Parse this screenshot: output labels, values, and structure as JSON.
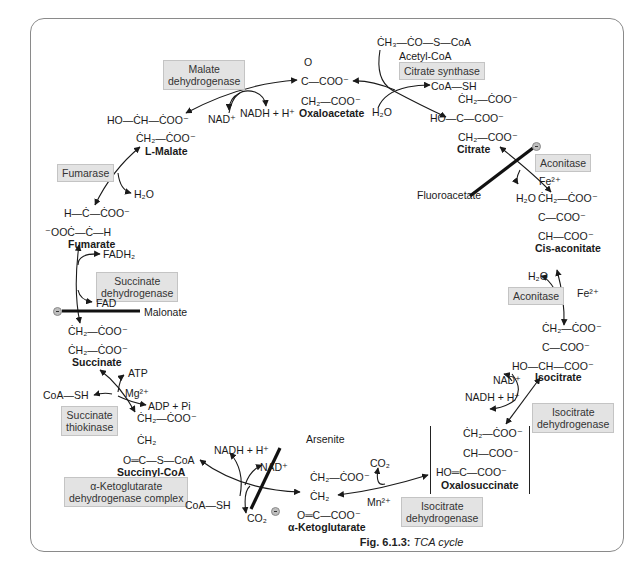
{
  "caption": {
    "label": "Fig. 6.1.3:",
    "title": "TCA cycle"
  },
  "compounds": {
    "acetyl_coa": {
      "formula": "ĊH₃—ĊO—S—CoA",
      "name": "Acetyl-CoA"
    },
    "oxaloacetate": {
      "top": "O",
      "line1": "C—COO⁻",
      "line2": "CH₂—COO⁻",
      "name": "Oxaloacetate"
    },
    "citrate": {
      "line1": "ĊH₂—ĊOO⁻",
      "line2": "HO—C—COO⁻",
      "line3": "CH₂—COO⁻",
      "name": "Citrate"
    },
    "cis_aconitate": {
      "line1": "ĊH₂—ĊOO⁻",
      "line2": "C—COO⁻",
      "line3": "CH—COO⁻",
      "name": "Cis-aconitate"
    },
    "isocitrate": {
      "line1": "ĊH₂—ĊOO⁻",
      "line2": "C—COO⁻",
      "line3": "HO—CH—COO⁻",
      "name": "Isocitrate"
    },
    "oxalosuccinate": {
      "line1": "ĊH₂—ĊOO⁻",
      "line2": "CH—COO⁻",
      "line3": "HO═C—COO⁻",
      "name": "Oxalosuccinate"
    },
    "alpha_ketoglutarate": {
      "line1": "ĊH₂—ĊOO⁻",
      "line2": "ĊH₂",
      "line3": "O═C—COO⁻",
      "name": "α-Ketoglutarate"
    },
    "succinyl_coa": {
      "line1": "ĊH₂—ĊOO⁻",
      "line2": "ĊH₂",
      "line3": "O═C—S—CoA",
      "name": "Succinyl-CoA"
    },
    "succinate": {
      "line1": "ĊH₂—ĊOO⁻",
      "line2": "ĊH₂—ĊOO⁻",
      "name": "Succinate"
    },
    "fumarate": {
      "line1": "H—Ċ—ĊOO⁻",
      "line2": "⁻OOĊ—Ċ—H",
      "name": "Fumarate"
    },
    "l_malate": {
      "line1": "HO—ĊH—ĊOO⁻",
      "line2": "ĊH₂—ĊOO⁻",
      "name": "L-Malate"
    }
  },
  "enzymes": {
    "citrate_synthase": "Citrate synthase",
    "aconitase_1": "Aconitase",
    "aconitase_2": "Aconitase",
    "isocitrate_dh_1": [
      "Isocitrate",
      "dehydrogenase"
    ],
    "isocitrate_dh_2": [
      "Isocitrate",
      "dehydrogenase"
    ],
    "akg_dh_complex": [
      "α-Ketoglutarate",
      "dehydrogenase complex"
    ],
    "succinate_thiokinase": [
      "Succinate",
      "thiokinase"
    ],
    "succinate_dh": [
      "Succinate",
      "dehydrogenase"
    ],
    "fumarase": "Fumarase",
    "malate_dh": [
      "Malate",
      "dehydrogenase"
    ]
  },
  "cofactors": {
    "h2o_citrate": "H₂O",
    "coash_citrate": "CoA—SH",
    "fe_1": "Fe²⁺",
    "h2o_aconitase_1": "H₂O",
    "fe_2": "Fe²⁺",
    "h2o_aconitase_2": "H₂O",
    "nad_isocitrate": "NAD⁺",
    "nadh_isocitrate": "NADH + H⁺",
    "co2_oxalosuccinate": "CO₂",
    "mn": "Mn²⁺",
    "nadh_akg": "NADH + H⁺",
    "nad_akg": "NAD⁺",
    "coash_akg": "CoA—SH",
    "co2_akg": "CO₂",
    "atp": "ATP",
    "mg": "Mg²⁺",
    "adp_pi": "ADP + Pi",
    "coash_thiokinase": "CoA—SH",
    "fadh2": "FADH₂",
    "fad": "FAD",
    "h2o_fumarase": "H₂O",
    "nad_malate": "NAD⁺",
    "nadh_malate": "NADH + H⁺"
  },
  "inhibitors": {
    "fluoroacetate": "Fluoroacetate",
    "malonate": "Malonate",
    "arsenite": "Arsenite"
  }
}
